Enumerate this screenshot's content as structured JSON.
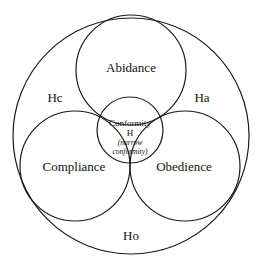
{
  "diagram": {
    "type": "nested-venn",
    "outer_region": {
      "label": "Ho"
    },
    "regions": [
      {
        "id": "abidance",
        "label": "Abidance"
      },
      {
        "id": "compliance",
        "label": "Compliance"
      },
      {
        "id": "obedience",
        "label": "Obedience"
      }
    ],
    "gap_labels": {
      "left": "Hc",
      "right": "Ha",
      "bottom": "Ho"
    },
    "center": {
      "title": "Conformity",
      "symbol": "H",
      "subtitle_line1": "(narrow",
      "subtitle_line2": "conformity)"
    }
  }
}
